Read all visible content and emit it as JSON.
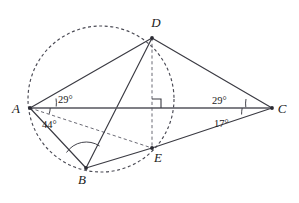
{
  "figure": {
    "background_color": "#ffffff",
    "line_color": "#3a3a42",
    "dash_color": "#6a6a74",
    "label_color": "#1a1a1a"
  },
  "points": {
    "A": {
      "label": "A",
      "x": 30,
      "y": 108,
      "label_x": 16,
      "label_y": 113
    },
    "B": {
      "label": "B",
      "x": 86,
      "y": 168,
      "label_x": 82,
      "label_y": 184
    },
    "C": {
      "label": "C",
      "x": 272,
      "y": 108,
      "label_x": 282,
      "label_y": 113
    },
    "D": {
      "label": "D",
      "x": 152,
      "y": 38,
      "label_x": 156,
      "label_y": 27
    },
    "E": {
      "label": "E",
      "x": 152,
      "y": 148,
      "label_x": 158,
      "label_y": 162
    }
  },
  "circle": {
    "name": "circumcircle-ADBE",
    "center_x": 101,
    "center_y": 99,
    "radius": 73,
    "style": "dashed",
    "passes_through": [
      "A",
      "D",
      "B",
      "E"
    ]
  },
  "segments": [
    {
      "name": "segment-AC",
      "from": "A",
      "to": "C",
      "style": "solid-base"
    },
    {
      "name": "segment-AD",
      "from": "A",
      "to": "D",
      "style": "solid"
    },
    {
      "name": "segment-AB",
      "from": "A",
      "to": "B",
      "style": "solid"
    },
    {
      "name": "segment-DC",
      "from": "D",
      "to": "C",
      "style": "solid"
    },
    {
      "name": "segment-DB",
      "from": "D",
      "to": "B",
      "style": "solid"
    },
    {
      "name": "segment-BE",
      "from": "B",
      "to": "E",
      "style": "solid"
    },
    {
      "name": "segment-EC",
      "from": "E",
      "to": "C",
      "style": "solid"
    },
    {
      "name": "segment-DE",
      "from": "D",
      "to": "E",
      "style": "dashed"
    },
    {
      "name": "segment-AE",
      "from": "A",
      "to": "E",
      "style": "dashed"
    }
  ],
  "angles": [
    {
      "name": "angle-DAC",
      "value": "29°",
      "vertex": "A",
      "label_x": 58,
      "label_y": 101,
      "arc_radius": 26,
      "start_deg": -28,
      "end_deg": 0,
      "ticks": 1
    },
    {
      "name": "angle-CAE",
      "value": "44°",
      "vertex": "A",
      "label_x": 42,
      "label_y": 126,
      "arc_radius": 20,
      "start_deg": 0,
      "end_deg": 16,
      "ticks": 1
    },
    {
      "name": "angle-DCA",
      "value": "29°",
      "vertex": "C",
      "label_x": 214,
      "label_y": 103,
      "arc_radius": 26,
      "start_deg": 180,
      "end_deg": 208,
      "ticks": 1
    },
    {
      "name": "angle-ACE",
      "value": "17°",
      "vertex": "C",
      "label_x": 216,
      "label_y": 125,
      "arc_radius": 30,
      "start_deg": 168,
      "end_deg": 180,
      "ticks": 1
    },
    {
      "name": "angle-ABD",
      "value": "",
      "vertex": "B",
      "label_x": 0,
      "label_y": 0,
      "arc_radius": 24,
      "start_deg": 0,
      "end_deg": 0,
      "ticks": 1
    }
  ],
  "markers": {
    "right_angle": {
      "name": "right-angle-marker-at-AC-DE",
      "symbol": "square",
      "x": 152,
      "y": 108,
      "size": 9,
      "description": "right angle where DE meets AC"
    }
  }
}
